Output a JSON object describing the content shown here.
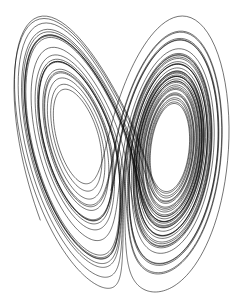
{
  "figure": {
    "background": "#ffffff",
    "stroke_color": "#000000",
    "stroke_width": 0.55
  },
  "lorenz": {
    "sigma": 10,
    "rho": 28,
    "beta": 2.6667,
    "initial": [
      -12.0,
      -18.0,
      12.0
    ],
    "dt": 0.005,
    "steps": 9000
  },
  "projection": {
    "width": 247,
    "height": 306,
    "left_lobe_center": [
      67,
      148
    ],
    "right_lobe_center": [
      160,
      150
    ]
  }
}
